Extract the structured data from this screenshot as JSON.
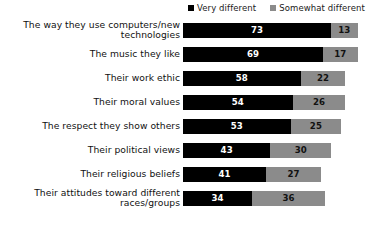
{
  "chart_data": {
    "type": "bar",
    "orientation": "horizontal",
    "stacked": true,
    "title": "",
    "subtitle": "",
    "xlabel": "",
    "ylabel": "",
    "grid": false,
    "legend_position": "top-right",
    "xlim": [
      0,
      90
    ],
    "categories": [
      "The way they use computers/new technologies",
      "The music they like",
      "Their work ethic",
      "Their moral values",
      "The respect they show others",
      "Their political views",
      "Their religious beliefs",
      "Their attitudes toward different races/groups"
    ],
    "series": [
      {
        "name": "Very different",
        "color": "#000000",
        "values": [
          73,
          69,
          58,
          54,
          53,
          43,
          41,
          34
        ]
      },
      {
        "name": "Somewhat different",
        "color": "#8b8b8b",
        "values": [
          13,
          17,
          22,
          26,
          25,
          30,
          27,
          36
        ]
      }
    ],
    "totals": [
      86,
      86,
      80,
      80,
      78,
      73,
      68,
      70
    ]
  },
  "legend": {
    "entries": [
      {
        "label": "Very different",
        "color": "#000000",
        "swatch": "square-marker-icon"
      },
      {
        "label": "Somewhat different",
        "color": "#8b8b8b",
        "swatch": "square-marker-icon"
      }
    ]
  },
  "rows": [
    {
      "label_line1": "The way they use computers/new",
      "label_line2": "technologies",
      "very": 73,
      "somewhat": 13
    },
    {
      "label_line1": "The music they like",
      "label_line2": "",
      "very": 69,
      "somewhat": 17
    },
    {
      "label_line1": "Their work ethic",
      "label_line2": "",
      "very": 58,
      "somewhat": 22
    },
    {
      "label_line1": "Their moral values",
      "label_line2": "",
      "very": 54,
      "somewhat": 26
    },
    {
      "label_line1": "The respect they show others",
      "label_line2": "",
      "very": 53,
      "somewhat": 25
    },
    {
      "label_line1": "Their political views",
      "label_line2": "",
      "very": 43,
      "somewhat": 30
    },
    {
      "label_line1": "Their religious beliefs",
      "label_line2": "",
      "very": 41,
      "somewhat": 27
    },
    {
      "label_line1": "Their attitudes toward different",
      "label_line2": "races/groups",
      "very": 34,
      "somewhat": 36
    }
  ],
  "scale": {
    "px_per_unit": 2.03,
    "bar_origin_x": 183
  }
}
